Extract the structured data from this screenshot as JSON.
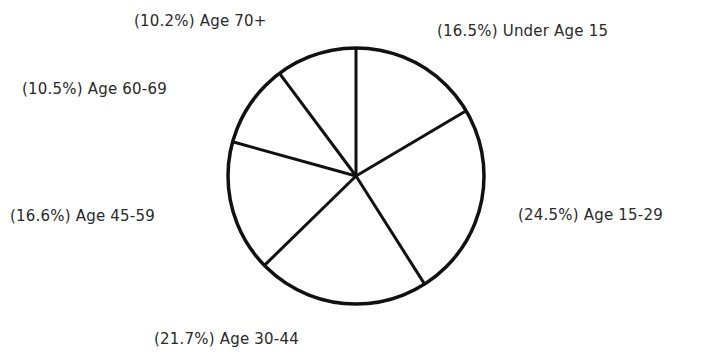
{
  "chart_data": {
    "type": "pie",
    "title": "",
    "categories": [
      "Under Age 15",
      "Age 15-29",
      "Age 30-44",
      "Age 45-59",
      "Age 60-69",
      "Age 70+"
    ],
    "values": [
      16.5,
      24.5,
      21.7,
      16.6,
      10.5,
      10.2
    ],
    "unit": "%",
    "start_angle": "12 o'clock, clockwise",
    "legend": "none (labels placed around pie)",
    "labels": [
      "(16.5%) Under Age 15",
      "(24.5%) Age 15-29",
      "(21.7%) Age 30-44",
      "(16.6%) Age 45-59",
      "(10.5%) Age 60-69",
      "(10.2%) Age 70+"
    ]
  },
  "colors": {
    "stroke": "#111111",
    "fill": "#ffffff",
    "text": "#2a2a2a"
  }
}
